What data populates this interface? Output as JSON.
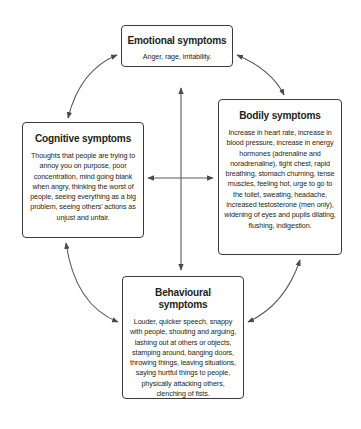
{
  "boxes": {
    "emotional": {
      "title": "Emotional symptoms",
      "text": "Anger, rage, irritability."
    },
    "cognitive": {
      "title": "Cognitive symptoms",
      "text": "Thoughts that people are trying to annoy you on purpose, poor concentration, mind going blank when angry, thinking the worst of people, seeing everything as a big problem, seeing others' actions as unjust and unfair."
    },
    "bodily": {
      "title": "Bodily symptoms",
      "text": "Increase in heart rate, increase in blood pressure, increase in energy hormones (adrenaline and noradrenaline), tight chest, rapid breathing, stomach churning, tense muscles, feeling hot, urge to go to the toilet, sweating, headache, increased testosterone (men only), widening of eyes and pupils dilating, flushing, indigestion."
    },
    "behavioural": {
      "title": "Behavioural symptoms",
      "text": "Louder, quicker speech, snappy with people, shouting and arguing, lashing out at others or objects, stamping around, banging doors, throwing things, leaving situations, saying hurtful things to people, physically attacking others, clenching of fists."
    }
  },
  "colors": {
    "line": "#3a3a3a",
    "text": "#231f20",
    "background": "#ffffff"
  }
}
